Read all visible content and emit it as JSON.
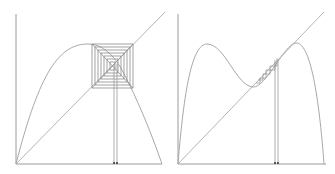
{
  "figure": {
    "colors": {
      "axis": "#9a9a9a",
      "curve": "#a8a8a8",
      "diagonal": "#b5b5b5",
      "cobweb": "#8c8c8c",
      "marker": "#555555",
      "background": "#ffffff"
    }
  },
  "panels": [
    {
      "id": "left",
      "map": "unimodal (logistic-like) map",
      "origin": [
        16,
        164
      ],
      "width": 146,
      "height": 150,
      "features": [
        "parabolic curve",
        "identity diagonal",
        "nested square cobweb converging to fixed point",
        "two vertical lines to x-axis with markers"
      ]
    },
    {
      "id": "right",
      "map": "bimodal map",
      "origin": [
        178,
        164
      ],
      "width": 148,
      "height": 150,
      "features": [
        "double-hump curve",
        "identity diagonal",
        "cobweb near tangency",
        "two vertical lines to x-axis with markers"
      ]
    }
  ]
}
